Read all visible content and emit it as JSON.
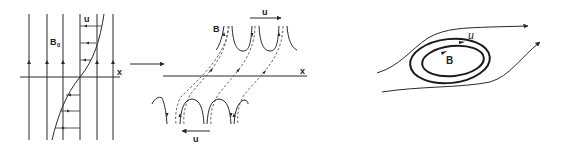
{
  "panels": {
    "left": {
      "field_label": "B",
      "field_subscript": "0",
      "velocity_label": "u",
      "axis_label": "x"
    },
    "middle": {
      "field_label": "B",
      "top_velocity_label": "u",
      "bottom_velocity_label": "u",
      "axis_label": "x"
    },
    "right": {
      "velocity_label": "u",
      "field_label": "B"
    }
  },
  "colors": {
    "ink": "#2a2a2a",
    "background": "#ffffff"
  }
}
